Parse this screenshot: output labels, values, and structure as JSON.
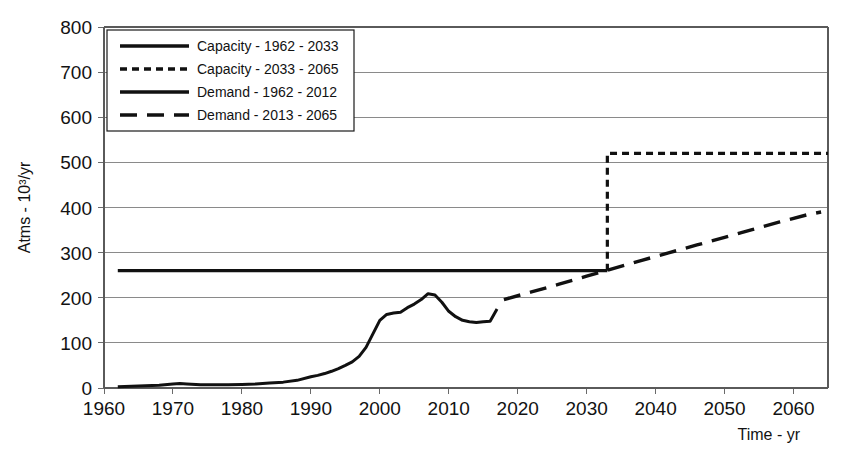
{
  "chart_data": {
    "type": "line",
    "title": "",
    "xlabel": "Time - yr",
    "ylabel": "Atms - 10³/yr",
    "xlim": [
      1960,
      2065
    ],
    "ylim": [
      0,
      800
    ],
    "grid": true,
    "legend_position": "top-left",
    "x_ticks": [
      "1960",
      "1970",
      "1980",
      "1990",
      "2000",
      "2010",
      "2020",
      "2030",
      "2040",
      "2050",
      "2060"
    ],
    "x_tick_values": [
      1960,
      1970,
      1980,
      1990,
      2000,
      2010,
      2020,
      2030,
      2040,
      2050,
      2060
    ],
    "y_ticks": [
      "0",
      "100",
      "200",
      "300",
      "400",
      "500",
      "600",
      "700",
      "800"
    ],
    "y_tick_values": [
      0,
      100,
      200,
      300,
      400,
      500,
      600,
      700,
      800
    ],
    "series": [
      {
        "name": "Capacity - 1962 - 2033",
        "style": "solid",
        "width": 3.2,
        "color": "#111111",
        "points": [
          [
            1962,
            260
          ],
          [
            1980,
            260
          ],
          [
            2000,
            260
          ],
          [
            2020,
            260
          ],
          [
            2033,
            260
          ]
        ]
      },
      {
        "name": "Capacity - 2033 - 2065",
        "style": "dashed-short",
        "width": 3.2,
        "color": "#111111",
        "points": [
          [
            2033,
            260
          ],
          [
            2033,
            520
          ],
          [
            2040,
            520
          ],
          [
            2050,
            520
          ],
          [
            2060,
            520
          ],
          [
            2065,
            520
          ]
        ]
      },
      {
        "name": "Demand - 1962 - 2012",
        "style": "solid",
        "width": 3.0,
        "color": "#111111",
        "points": [
          [
            1962,
            3
          ],
          [
            1964,
            4
          ],
          [
            1966,
            5
          ],
          [
            1968,
            6
          ],
          [
            1970,
            9
          ],
          [
            1971,
            10
          ],
          [
            1972,
            9
          ],
          [
            1974,
            7
          ],
          [
            1976,
            7
          ],
          [
            1978,
            7
          ],
          [
            1980,
            8
          ],
          [
            1982,
            9
          ],
          [
            1984,
            11
          ],
          [
            1986,
            13
          ],
          [
            1988,
            17
          ],
          [
            1990,
            25
          ],
          [
            1991,
            28
          ],
          [
            1992,
            32
          ],
          [
            1993,
            37
          ],
          [
            1994,
            43
          ],
          [
            1995,
            50
          ],
          [
            1996,
            58
          ],
          [
            1997,
            70
          ],
          [
            1998,
            90
          ],
          [
            1999,
            120
          ],
          [
            2000,
            150
          ],
          [
            2001,
            163
          ],
          [
            2002,
            166
          ],
          [
            2003,
            168
          ],
          [
            2004,
            178
          ],
          [
            2005,
            186
          ],
          [
            2006,
            196
          ],
          [
            2007,
            209
          ],
          [
            2008,
            206
          ],
          [
            2009,
            190
          ],
          [
            2010,
            170
          ],
          [
            2011,
            158
          ],
          [
            2012,
            150
          ],
          [
            2013,
            147
          ],
          [
            2014,
            145
          ],
          [
            2015,
            147
          ],
          [
            2016,
            148
          ],
          [
            2017,
            175
          ]
        ]
      },
      {
        "name": "Demand - 2013 - 2065",
        "style": "dashed-long",
        "width": 3.4,
        "color": "#111111",
        "points": [
          [
            2018,
            196
          ],
          [
            2022,
            213
          ],
          [
            2026,
            230
          ],
          [
            2030,
            248
          ],
          [
            2033,
            261
          ],
          [
            2038,
            283
          ],
          [
            2042,
            300
          ],
          [
            2046,
            317
          ],
          [
            2050,
            334
          ],
          [
            2054,
            351
          ],
          [
            2058,
            368
          ],
          [
            2062,
            384
          ],
          [
            2064,
            390
          ]
        ]
      }
    ],
    "annotations": {
      "capacity_step_year": 2033,
      "capacity_low": 260,
      "capacity_high": 520,
      "demand_peak_year": 2007,
      "demand_peak_value": 209,
      "demand_trough_year": 2014,
      "demand_trough_value": 145,
      "demand_end_value": 390
    }
  },
  "legend": {
    "items": [
      {
        "label": "Capacity - 1962 - 2033",
        "style": "solid"
      },
      {
        "label": "Capacity - 2033 - 2065",
        "style": "dashed-short"
      },
      {
        "label": "Demand - 1962 - 2012",
        "style": "solid"
      },
      {
        "label": "Demand - 2013 - 2065",
        "style": "dashed-long"
      }
    ]
  },
  "colors": {
    "ink": "#111111",
    "grid": "#8a8a8a",
    "background": "#ffffff"
  }
}
